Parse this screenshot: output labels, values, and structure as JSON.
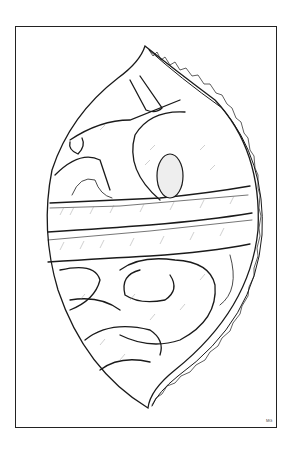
{
  "illustration": {
    "subject": "surgical view of opened abdomen showing transverse colon and small intestine loops",
    "signature": "MG",
    "colors": {
      "ink": "#1a1a1a",
      "paper": "#ffffff"
    }
  }
}
